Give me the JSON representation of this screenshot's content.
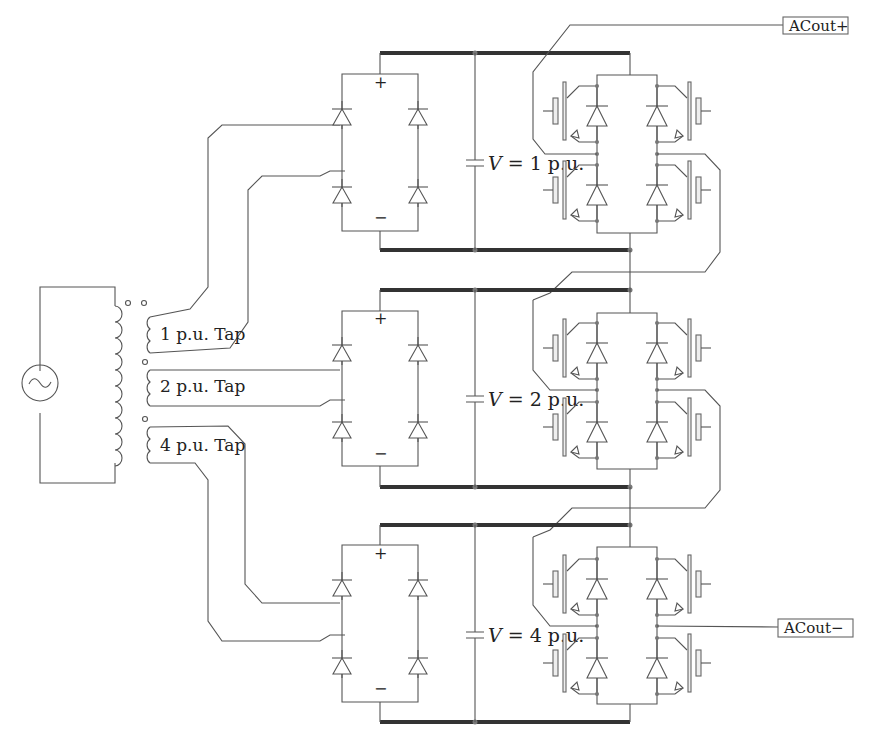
{
  "diagram": {
    "type": "cascaded H-bridge multilevel inverter with transformer taps",
    "source": {
      "icon": "ac-source-icon",
      "symbol": "~"
    },
    "transformer": {
      "taps": [
        {
          "label": "1 p.u. Tap"
        },
        {
          "label": "2 p.u. Tap"
        },
        {
          "label": "4 p.u. Tap"
        }
      ]
    },
    "stages": [
      {
        "rectifier": {
          "plus": "+",
          "minus": "−"
        },
        "capacitor": {
          "v": "V",
          "eq": " = 1 p.u."
        }
      },
      {
        "rectifier": {
          "plus": "+",
          "minus": "−"
        },
        "capacitor": {
          "v": "V",
          "eq": " = 2 p.u."
        }
      },
      {
        "rectifier": {
          "plus": "+",
          "minus": "−"
        },
        "capacitor": {
          "v": "V",
          "eq": " = 4 p.u."
        }
      }
    ],
    "outputs": {
      "positive": "ACout+",
      "negative": "ACout−"
    }
  }
}
